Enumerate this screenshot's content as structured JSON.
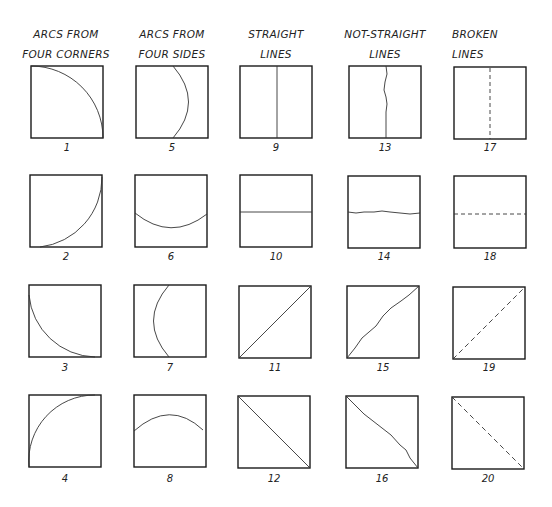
{
  "columns": [
    {
      "header_line1": "ARCS FROM",
      "header_line2": "FOUR CORNERS"
    },
    {
      "header_line1": "ARCS FROM",
      "header_line2": "FOUR SIDES"
    },
    {
      "header_line1": "STRAIGHT",
      "header_line2": "LINES"
    },
    {
      "header_line1": "NOT-STRAIGHT",
      "header_line2": "LINES"
    },
    {
      "header_line1": "BROKEN",
      "header_line2": "LINES"
    }
  ],
  "figures": [
    {
      "number": "1",
      "type": "arc-corner-top-left"
    },
    {
      "number": "2",
      "type": "arc-corner-bottom-left-to-top-right"
    },
    {
      "number": "3",
      "type": "arc-corner-left-to-bottom-right"
    },
    {
      "number": "4",
      "type": "arc-corner-bottom-left-to-top-right-convex"
    },
    {
      "number": "5",
      "type": "arc-side-right"
    },
    {
      "number": "6",
      "type": "arc-side-bottom"
    },
    {
      "number": "7",
      "type": "arc-side-left"
    },
    {
      "number": "8",
      "type": "arc-side-top"
    },
    {
      "number": "9",
      "type": "straight-vertical"
    },
    {
      "number": "10",
      "type": "straight-horizontal"
    },
    {
      "number": "11",
      "type": "straight-diagonal-up"
    },
    {
      "number": "12",
      "type": "straight-diagonal-down"
    },
    {
      "number": "13",
      "type": "wavy-vertical"
    },
    {
      "number": "14",
      "type": "wavy-horizontal"
    },
    {
      "number": "15",
      "type": "wavy-diagonal-up"
    },
    {
      "number": "16",
      "type": "wavy-diagonal-down"
    },
    {
      "number": "17",
      "type": "dashed-vertical"
    },
    {
      "number": "18",
      "type": "dashed-horizontal"
    },
    {
      "number": "19",
      "type": "dashed-diagonal-up"
    },
    {
      "number": "20",
      "type": "dashed-diagonal-down"
    }
  ],
  "colors": {
    "ink": "#1a1a1a",
    "paper": "#ffffff"
  }
}
